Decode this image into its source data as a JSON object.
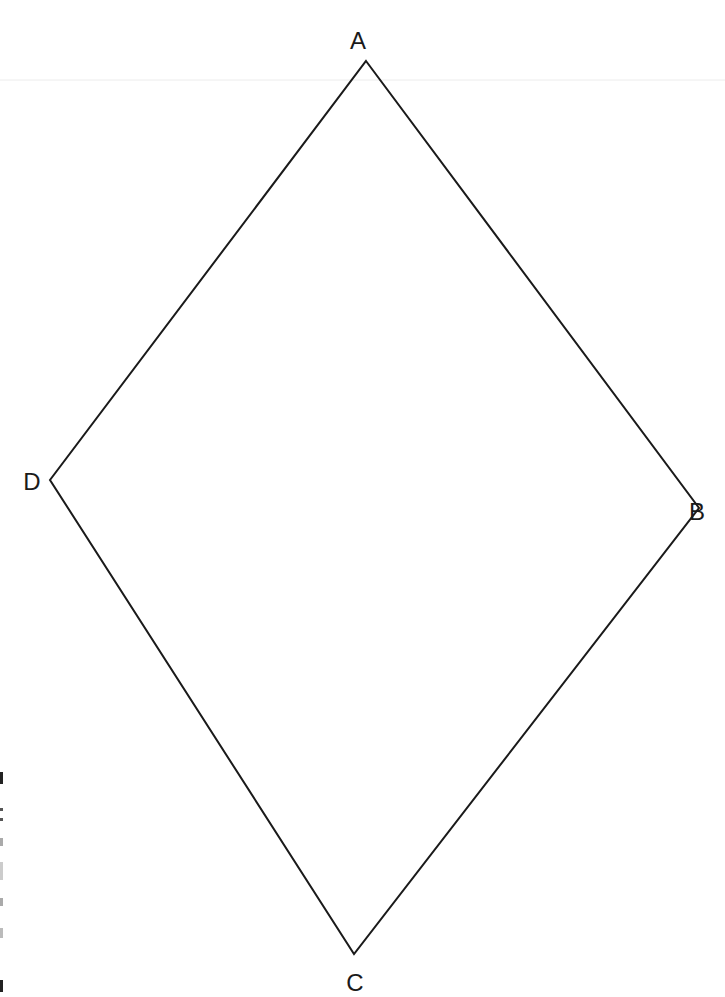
{
  "diagram": {
    "type": "quadrilateral",
    "shape": "rhombus",
    "stroke_color": "#1a1a1a",
    "vertices": [
      {
        "name": "A",
        "x": 366,
        "y": 61,
        "label_x": 358,
        "label_y": 49
      },
      {
        "name": "B",
        "x": 699,
        "y": 508,
        "label_x": 697,
        "label_y": 520
      },
      {
        "name": "C",
        "x": 354,
        "y": 954,
        "label_x": 355,
        "label_y": 991
      },
      {
        "name": "D",
        "x": 50,
        "y": 480,
        "label_x": 32,
        "label_y": 490
      }
    ],
    "edges": [
      [
        "A",
        "B"
      ],
      [
        "B",
        "C"
      ],
      [
        "C",
        "D"
      ],
      [
        "D",
        "A"
      ]
    ]
  },
  "labels": {
    "a": "A",
    "b": "B",
    "c": "C",
    "d": "D"
  }
}
